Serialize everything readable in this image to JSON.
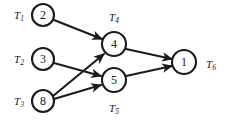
{
  "diagram": {
    "kind": "directed-task-graph",
    "width": 229,
    "height": 129,
    "background_color": "#ffffff",
    "ink_color": "#1b1b1b",
    "nodes": [
      {
        "id": "T1",
        "label": "T",
        "subscript": "1",
        "value": "2",
        "cx": 43,
        "cy": 15,
        "r": 11,
        "label_x": 19,
        "label_y": 15,
        "label_pos": "left"
      },
      {
        "id": "T2",
        "label": "T",
        "subscript": "2",
        "value": "3",
        "cx": 43,
        "cy": 59,
        "r": 11,
        "label_x": 19,
        "label_y": 59,
        "label_pos": "left"
      },
      {
        "id": "T3",
        "label": "T",
        "subscript": "3",
        "value": "8",
        "cx": 43,
        "cy": 101,
        "r": 11,
        "label_x": 19,
        "label_y": 101,
        "label_pos": "left"
      },
      {
        "id": "T4",
        "label": "T",
        "subscript": "4",
        "value": "4",
        "cx": 114,
        "cy": 44,
        "r": 12,
        "label_x": 114,
        "label_y": 17,
        "label_pos": "above"
      },
      {
        "id": "T5",
        "label": "T",
        "subscript": "5",
        "value": "5",
        "cx": 114,
        "cy": 80,
        "r": 12,
        "label_x": 114,
        "label_y": 108,
        "label_pos": "below"
      },
      {
        "id": "T6",
        "label": "T",
        "subscript": "6",
        "value": "1",
        "cx": 184,
        "cy": 62,
        "r": 12,
        "label_x": 211,
        "label_y": 64,
        "label_pos": "right"
      }
    ],
    "edges": [
      {
        "id": "e1",
        "from": "T1",
        "to": "T4",
        "x1": 54,
        "y1": 20,
        "x2": 102,
        "y2": 39
      },
      {
        "id": "e2",
        "from": "T2",
        "to": "T5",
        "x1": 54,
        "y1": 63,
        "x2": 101,
        "y2": 76
      },
      {
        "id": "e3",
        "from": "T3",
        "to": "T4",
        "x1": 53,
        "y1": 96,
        "x2": 104,
        "y2": 54
      },
      {
        "id": "e4",
        "from": "T3",
        "to": "T5",
        "x1": 54,
        "y1": 99,
        "x2": 101,
        "y2": 85
      },
      {
        "id": "e5",
        "from": "T4",
        "to": "T6",
        "x1": 126,
        "y1": 49,
        "x2": 172,
        "y2": 59
      },
      {
        "id": "e6",
        "from": "T5",
        "to": "T6",
        "x1": 126,
        "y1": 76,
        "x2": 172,
        "y2": 66
      }
    ]
  }
}
